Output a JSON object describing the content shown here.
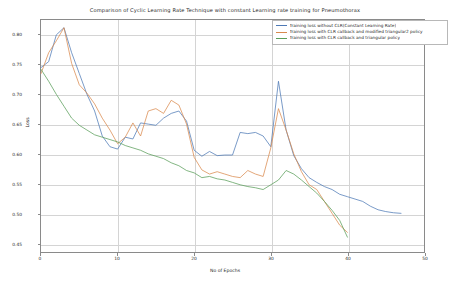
{
  "chart_data": {
    "type": "line",
    "title": "Comparison of Cyclic Learning Rate Technique with constant Learning rate training for Pneumothorax",
    "xlabel": "No of Epochs",
    "ylabel": "Loss",
    "xlim": [
      0,
      50
    ],
    "ylim": [
      0.435,
      0.825
    ],
    "xticks": [
      "0",
      "10",
      "20",
      "30",
      "40",
      "50"
    ],
    "xtick_values": [
      0,
      10,
      20,
      30,
      40,
      50
    ],
    "yticks": [
      "0.45",
      "0.50",
      "0.55",
      "0.60",
      "0.65",
      "0.70",
      "0.75",
      "0.80"
    ],
    "ytick_values": [
      0.45,
      0.5,
      0.55,
      0.6,
      0.65,
      0.7,
      0.75,
      0.8
    ],
    "grid": true,
    "legend_position": "upper right",
    "series": [
      {
        "name": "Training loss without CLR(Constant Learning Rate)",
        "color": "#4e79b5",
        "x": [
          0,
          1,
          2,
          3,
          4,
          5,
          6,
          7,
          8,
          9,
          10,
          11,
          12,
          13,
          14,
          15,
          16,
          17,
          18,
          19,
          20,
          21,
          22,
          23,
          24,
          25,
          26,
          27,
          28,
          29,
          30,
          31,
          32,
          33,
          34,
          35,
          36,
          37,
          38,
          39,
          40,
          41,
          42,
          43,
          44,
          45,
          46,
          47
        ],
        "values": [
          0.745,
          0.755,
          0.8,
          0.812,
          0.77,
          0.735,
          0.7,
          0.672,
          0.63,
          0.612,
          0.608,
          0.628,
          0.625,
          0.652,
          0.65,
          0.648,
          0.66,
          0.668,
          0.672,
          0.655,
          0.606,
          0.596,
          0.604,
          0.597,
          0.598,
          0.598,
          0.636,
          0.634,
          0.636,
          0.63,
          0.612,
          0.722,
          0.64,
          0.597,
          0.575,
          0.56,
          0.552,
          0.545,
          0.54,
          0.532,
          0.528,
          0.524,
          0.52,
          0.512,
          0.506,
          0.503,
          0.501,
          0.5
        ]
      },
      {
        "name": "Training loss with CLR callback and modified triangular2 policy",
        "color": "#d98a4e",
        "x": [
          0,
          1,
          2,
          3,
          4,
          5,
          6,
          7,
          8,
          9,
          10,
          11,
          12,
          13,
          14,
          15,
          16,
          17,
          18,
          19,
          20,
          21,
          22,
          23,
          24,
          25,
          26,
          27,
          28,
          29,
          30,
          31,
          32,
          33,
          34,
          35,
          36,
          37,
          38,
          39,
          40
        ],
        "values": [
          0.735,
          0.77,
          0.79,
          0.812,
          0.752,
          0.716,
          0.702,
          0.684,
          0.66,
          0.64,
          0.617,
          0.628,
          0.652,
          0.63,
          0.672,
          0.676,
          0.668,
          0.69,
          0.682,
          0.65,
          0.594,
          0.573,
          0.566,
          0.57,
          0.566,
          0.562,
          0.56,
          0.572,
          0.566,
          0.562,
          0.61,
          0.676,
          0.64,
          0.6,
          0.57,
          0.548,
          0.54,
          0.52,
          0.5,
          0.48,
          0.468
        ]
      },
      {
        "name": "Training loss with CLR callback and triangular policy",
        "color": "#5a9e5a",
        "x": [
          0,
          1,
          2,
          3,
          4,
          5,
          6,
          7,
          8,
          9,
          10,
          11,
          12,
          13,
          14,
          15,
          16,
          17,
          18,
          19,
          20,
          21,
          22,
          23,
          24,
          25,
          26,
          27,
          28,
          29,
          30,
          31,
          32,
          33,
          34,
          35,
          36,
          37,
          38,
          39,
          40
        ],
        "values": [
          0.742,
          0.722,
          0.7,
          0.68,
          0.66,
          0.648,
          0.64,
          0.632,
          0.628,
          0.624,
          0.62,
          0.614,
          0.61,
          0.606,
          0.6,
          0.596,
          0.592,
          0.585,
          0.58,
          0.572,
          0.568,
          0.56,
          0.562,
          0.558,
          0.556,
          0.552,
          0.548,
          0.545,
          0.543,
          0.54,
          0.548,
          0.556,
          0.572,
          0.566,
          0.556,
          0.545,
          0.534,
          0.52,
          0.505,
          0.488,
          0.46
        ]
      }
    ]
  },
  "legend": {
    "items": [
      "Training loss without CLR(Constant Learning Rate)",
      "Training loss with CLR callback and modified triangular2 policy",
      "Training loss with CLR callback and triangular policy"
    ]
  }
}
